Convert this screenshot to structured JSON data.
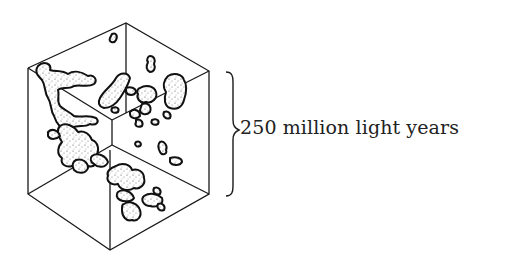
{
  "figure": {
    "scale_label": "250 million light years",
    "brace_side": "right",
    "colors": {
      "line": "#1a1a1a",
      "blob_outline": "#111111",
      "blob_fill": "#ffffff",
      "speckle": "#555555",
      "text": "#222222",
      "background": "#ffffff"
    }
  }
}
